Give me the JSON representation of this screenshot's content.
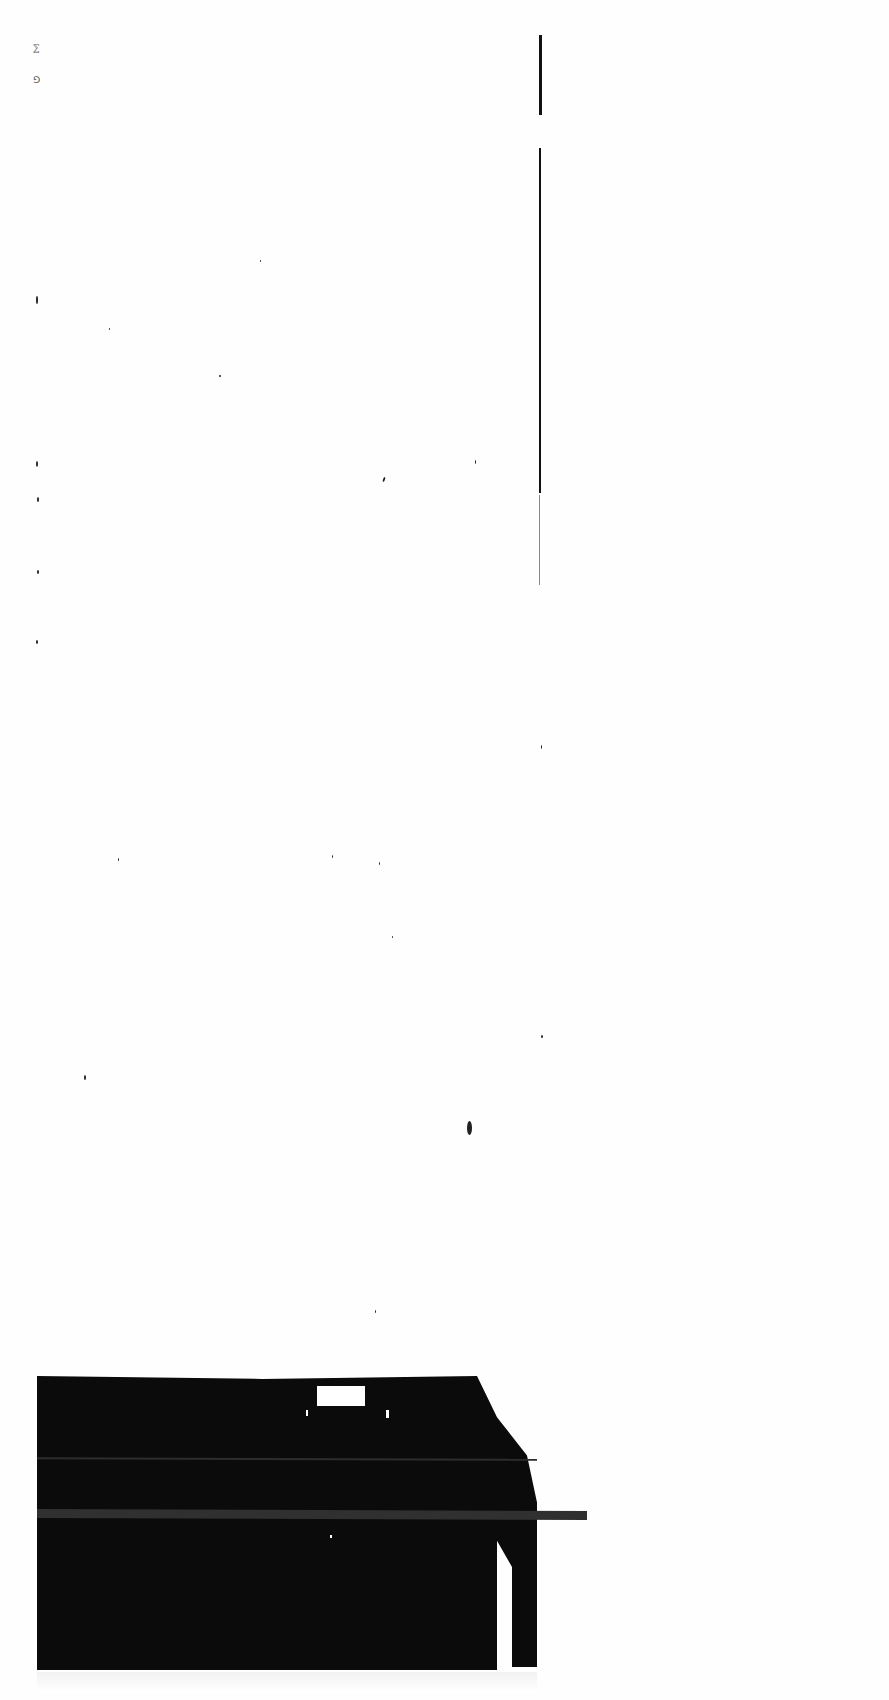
{
  "document": {
    "type": "scanned-page",
    "text_content": "",
    "corner_marks": [
      "⅀",
      "⅁"
    ],
    "colors": {
      "paper": "#fefefe",
      "ink": "#111111",
      "scan_artifact": "#0b0b0b"
    }
  }
}
